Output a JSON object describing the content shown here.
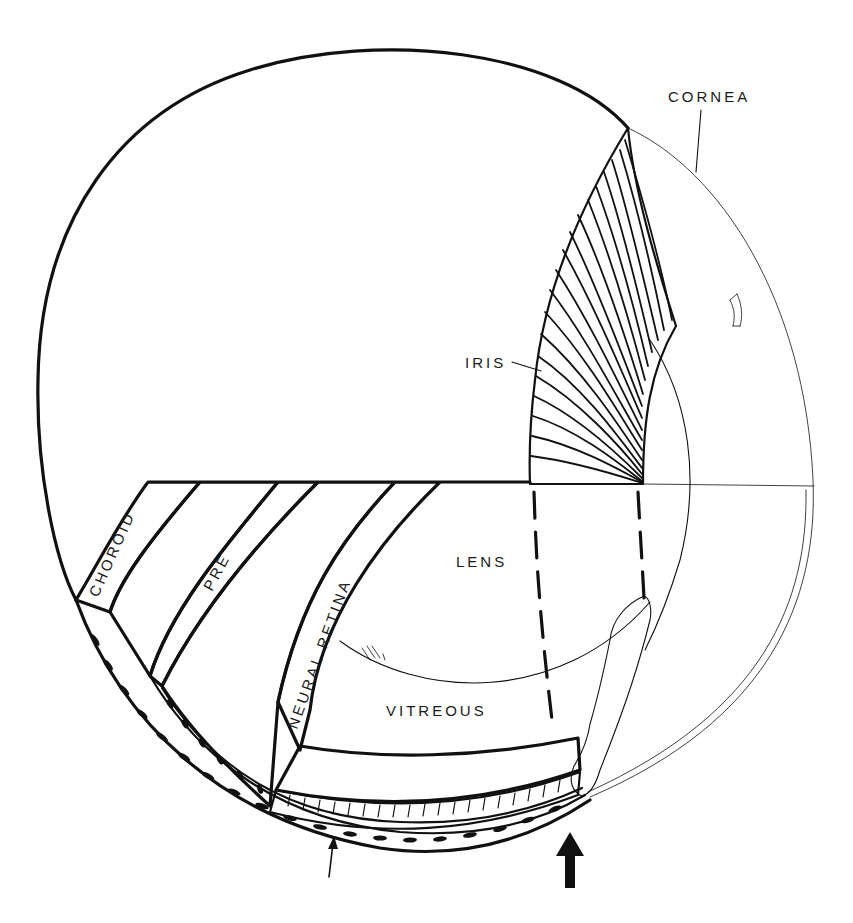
{
  "figure": {
    "labels": {
      "cornea": "CORNEA",
      "iris": "IRIS",
      "lens": "LENS",
      "vitreous": "VITREOUS",
      "choroid": "CHOROID",
      "pre": "PRE",
      "neural_retina": "NEURAL RETINA"
    },
    "arrows": [
      {
        "name": "thin-arrow",
        "style": "thin",
        "position": "bottom-center"
      },
      {
        "name": "bold-arrow",
        "style": "bold",
        "position": "bottom-right"
      }
    ],
    "colors": {
      "ink": "#111111",
      "background": "#ffffff",
      "pigment_fill": "#111111"
    }
  }
}
